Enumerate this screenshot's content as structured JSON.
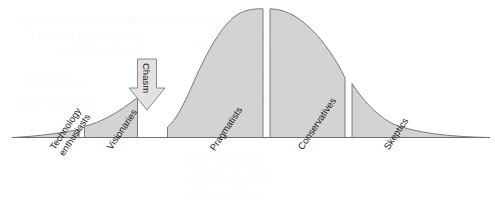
{
  "figure": {
    "width": 495,
    "height": 206,
    "background": "#ffffff",
    "fill_color": "#d3d3d3",
    "stroke_color": "#7a7a7a",
    "arrow_fill": "#e2e2e2",
    "arrow_stroke": "#8a8a8a",
    "label_color": "#1a1a1a"
  },
  "chasm": {
    "label": "Chasm",
    "rotation_deg": 90
  },
  "chart_data": {
    "type": "area",
    "title": "",
    "subtitle": "",
    "xlabel": "",
    "ylabel": "",
    "grid": false,
    "legend": "none",
    "categories": [
      "Technology enthusiasts",
      "Visionaries",
      "Pragmatists",
      "Conservatives",
      "Skeptics"
    ],
    "segments": [
      {
        "name": "Technology enthusiasts",
        "label_lines": [
          "Technology",
          "enthusiasts"
        ],
        "x_start": 12,
        "x_end": 79,
        "height_start": 0,
        "height_end": 8,
        "share_pct": 13
      },
      {
        "name": "Visionaries",
        "label_lines": [
          "Visionaries"
        ],
        "x_start": 84,
        "x_end": 138,
        "height_start": 12,
        "height_end": 40,
        "share_pct": 11
      },
      {
        "name": "Pragmatists",
        "label_lines": [
          "Pragmatists"
        ],
        "x_start": 167,
        "x_end": 263,
        "height_start": 11,
        "height_end": 129,
        "share_pct": 19
      },
      {
        "name": "Conservatives",
        "label_lines": [
          "Conservatives"
        ],
        "x_start": 270,
        "x_end": 345,
        "height_start": 129,
        "height_end": 60,
        "share_pct": 15
      },
      {
        "name": "Skeptics",
        "label_lines": [
          "Skeptics"
        ],
        "x_start": 352,
        "x_end": 490,
        "height_start": 60,
        "height_end": 0,
        "share_pct": 28
      }
    ],
    "baseline_y": 138,
    "peak_y": 9,
    "ylim": [
      0,
      138
    ],
    "xlim": [
      0,
      495
    ]
  },
  "labels": [
    {
      "text": "Technology\nenthusiasts",
      "x": 48,
      "y": 146,
      "rotation_deg": -56
    },
    {
      "text": "Visionaries",
      "x": 105,
      "y": 146,
      "rotation_deg": -56
    },
    {
      "text": "Pragmatists",
      "x": 208,
      "y": 147,
      "rotation_deg": -56
    },
    {
      "text": "Conservatives",
      "x": 296,
      "y": 146,
      "rotation_deg": -56
    },
    {
      "text": "Skeptics",
      "x": 382,
      "y": 146,
      "rotation_deg": -56
    }
  ],
  "bleed_through_text": [
    {
      "text": "ing the time to market the",
      "x": 18,
      "y": 14,
      "rotation_deg": 0
    },
    {
      "text": "en the marketing of the",
      "x": 128,
      "y": 12,
      "rotation_deg": 0
    },
    {
      "text": "product life cycle and",
      "x": 38,
      "y": 28,
      "rotation_deg": 0
    },
    {
      "text": "the adoption of a new",
      "x": 212,
      "y": 26,
      "rotation_deg": 0
    },
    {
      "text": "technology by the",
      "x": 62,
      "y": 42,
      "rotation_deg": 0
    },
    {
      "text": "market segments are",
      "x": 196,
      "y": 40,
      "rotation_deg": 0
    },
    {
      "text": "in the chasm",
      "x": 24,
      "y": 74,
      "rotation_deg": 0
    },
    {
      "text": "between the",
      "x": 210,
      "y": 72,
      "rotation_deg": 0
    },
    {
      "text": "early market and",
      "x": 18,
      "y": 96,
      "rotation_deg": 0
    },
    {
      "text": "the mainstream",
      "x": 236,
      "y": 94,
      "rotation_deg": 0
    },
    {
      "text": "is the innovation",
      "x": 186,
      "y": 152,
      "rotation_deg": 0
    },
    {
      "text": "of the product the",
      "x": 188,
      "y": 170,
      "rotation_deg": 0
    },
    {
      "text": "adopters of the",
      "x": 190,
      "y": 186,
      "rotation_deg": 0
    }
  ]
}
